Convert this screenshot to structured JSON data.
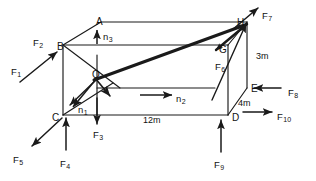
{
  "figure": {
    "canvas": {
      "width": 316,
      "height": 181
    },
    "stroke_color": "#1a1a1a",
    "background_color": "#ffffff"
  },
  "vertices": [
    {
      "id": "A",
      "label": "A",
      "x": 96,
      "y": 17
    },
    {
      "id": "B",
      "label": "B",
      "x": 57,
      "y": 42
    },
    {
      "id": "C",
      "label": "C",
      "x": 52,
      "y": 113
    },
    {
      "id": "D",
      "label": "D",
      "x": 232,
      "y": 113
    },
    {
      "id": "E",
      "label": "E",
      "x": 251,
      "y": 84
    },
    {
      "id": "G",
      "label": "G",
      "x": 219,
      "y": 45
    },
    {
      "id": "H",
      "label": "H",
      "x": 237,
      "y": 18
    },
    {
      "id": "O",
      "label": "O",
      "x": 92,
      "y": 70
    }
  ],
  "dimensions": [
    {
      "id": "length",
      "label": "12m",
      "x": 143,
      "y": 116
    },
    {
      "id": "depth",
      "label": "4m",
      "x": 238,
      "y": 99
    },
    {
      "id": "height",
      "label": "3m",
      "x": 256,
      "y": 52
    }
  ],
  "normals": [
    {
      "id": "n1",
      "base": "n",
      "sub": "1",
      "x": 78,
      "y": 105
    },
    {
      "id": "n2",
      "base": "n",
      "sub": "2",
      "x": 176,
      "y": 94
    },
    {
      "id": "n3",
      "base": "n",
      "sub": "3",
      "x": 103,
      "y": 32
    }
  ],
  "forces": [
    {
      "id": "F1",
      "base": "F",
      "sub": "1",
      "x": 11,
      "y": 67
    },
    {
      "id": "F2",
      "base": "F",
      "sub": "2",
      "x": 33,
      "y": 38
    },
    {
      "id": "F3",
      "base": "F",
      "sub": "3",
      "x": 93,
      "y": 130
    },
    {
      "id": "F4",
      "base": "F",
      "sub": "4",
      "x": 60,
      "y": 159
    },
    {
      "id": "F5",
      "base": "F",
      "sub": "5",
      "x": 13,
      "y": 155
    },
    {
      "id": "F6",
      "base": "F",
      "sub": "6",
      "x": 215,
      "y": 62
    },
    {
      "id": "F7",
      "base": "F",
      "sub": "7",
      "x": 262,
      "y": 11
    },
    {
      "id": "F8",
      "base": "F",
      "sub": "8",
      "x": 288,
      "y": 88
    },
    {
      "id": "F9",
      "base": "F",
      "sub": "9",
      "x": 214,
      "y": 160
    },
    {
      "id": "F10",
      "base": "F",
      "sub": "10",
      "x": 277,
      "y": 112
    }
  ]
}
